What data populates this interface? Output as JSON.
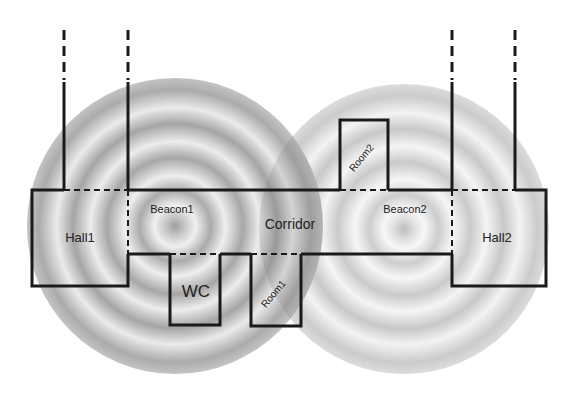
{
  "diagram": {
    "type": "indoor-floorplan-beacon-coverage",
    "colors": {
      "background": "#ffffff",
      "walls": "#1a1a1a",
      "beacon1_dark": "#8c8c8c",
      "beacon1_light": "#e6e6e6",
      "beacon2_dark": "#b0b0b0",
      "beacon2_light": "#f0f0f0"
    },
    "beacons": [
      {
        "id": "beacon1",
        "label": "Beacon1",
        "cx": 175,
        "cy": 226,
        "r": 148
      },
      {
        "id": "beacon2",
        "label": "Beacon2",
        "cx": 404,
        "cy": 229,
        "r": 145
      }
    ],
    "rooms": [
      {
        "id": "hall1",
        "label": "Hall1"
      },
      {
        "id": "corridor",
        "label": "Corridor"
      },
      {
        "id": "hall2",
        "label": "Hall2"
      },
      {
        "id": "wc",
        "label": "WC"
      },
      {
        "id": "room1",
        "label": "Room1"
      },
      {
        "id": "room2",
        "label": "Room2"
      }
    ]
  }
}
